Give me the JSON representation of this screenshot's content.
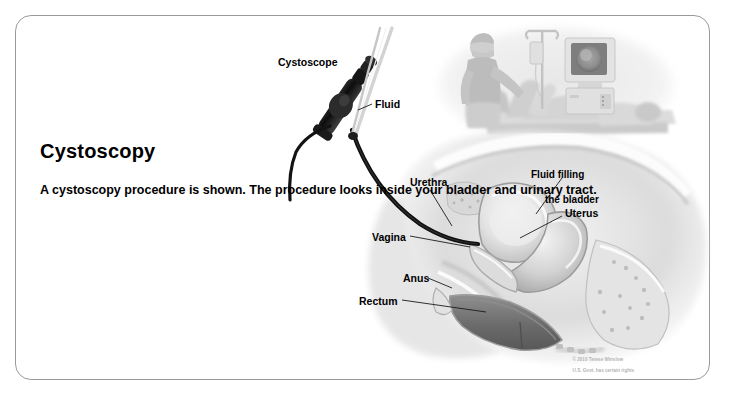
{
  "card": {
    "title": "Cystoscopy",
    "body": "A cystoscopy procedure is shown. The procedure looks inside your bladder and urinary tract."
  },
  "labels": {
    "cystoscope": "Cystoscope",
    "fluid": "Fluid",
    "urethra": "Urethra",
    "vagina": "Vagina",
    "anus": "Anus",
    "rectum": "Rectum",
    "uterus": "Uterus",
    "fluid_bladder_line1": "Fluid filling",
    "fluid_bladder_line2": "the bladder"
  },
  "credit": {
    "line1": "© 2010 Terese Winslow",
    "line2": "U.S. Govt. has certain rights"
  },
  "illustration": {
    "type": "medical-illustration",
    "view": "female pelvis sagittal cross-section",
    "inset_scene": "doctor performing cystoscopy on reclining patient with IV fluid stand and video monitor",
    "palette": {
      "background": "#ffffff",
      "border": "#9a9a9a",
      "scope_dark": "#141414",
      "tissue_light": "#e8e8e8",
      "tissue_mid": "#b8b8b8",
      "tissue_dark": "#8a8a8a",
      "cavity_dark": "#6e6e6e",
      "fluid_tube": "#cfcfcf",
      "leader_line": "#222222"
    }
  }
}
